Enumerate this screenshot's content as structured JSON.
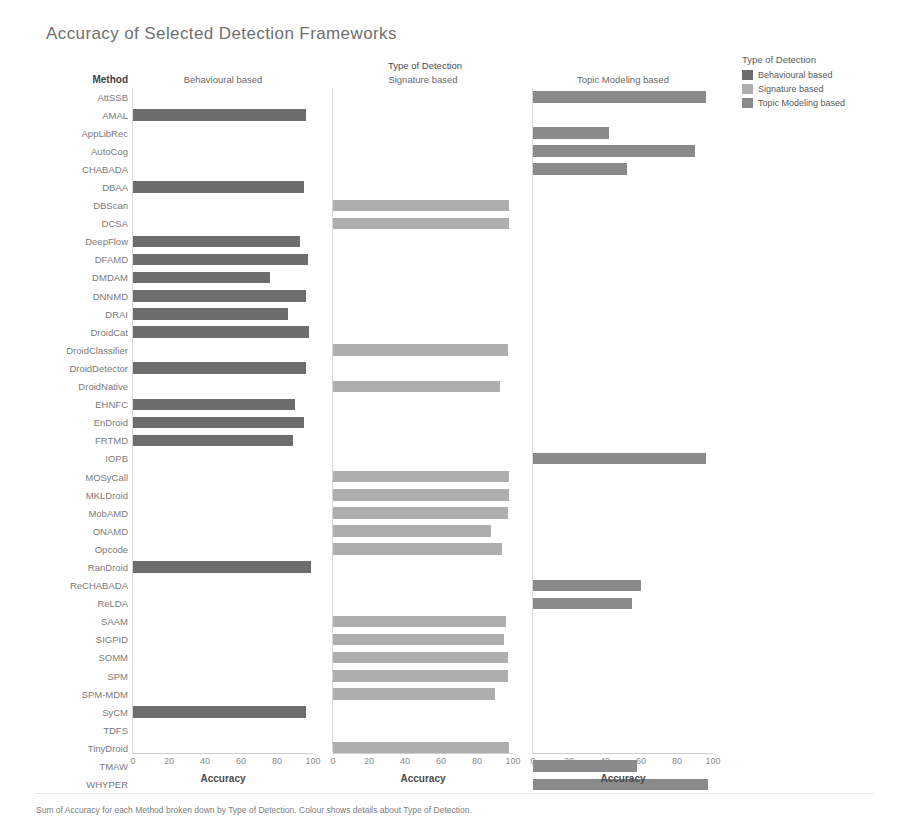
{
  "title": "Accuracy of Selected Detection Frameworks",
  "method_header": "Method",
  "column_group_title": "Type of Detection",
  "axis_title": "Accuracy",
  "footer": "Sum of Accuracy for each Method broken down by Type of Detection.  Colour shows details about Type of Detection.",
  "legend": {
    "title": "Type of Detection",
    "items": [
      {
        "label": "Behavioural based",
        "color": "#6d6d6d"
      },
      {
        "label": "Signature based",
        "color": "#aeaeae"
      },
      {
        "label": "Topic Modeling based",
        "color": "#8a8a8a"
      }
    ]
  },
  "chart_data": {
    "type": "bar",
    "title": "Accuracy of Selected Detection Frameworks",
    "xlabel": "Accuracy",
    "ylabel": "Method",
    "xlim": [
      0,
      100
    ],
    "ticks": [
      0,
      20,
      40,
      60,
      80,
      100
    ],
    "grid": false,
    "legend_position": "right",
    "panels": [
      "Behavioural based",
      "Signature based",
      "Topic Modeling based"
    ],
    "panel_colors": [
      "#6d6d6d",
      "#aeaeae",
      "#8a8a8a"
    ],
    "categories": [
      "AttSSB",
      "AMAL",
      "AppLibRec",
      "AutoCog",
      "CHABADA",
      "DBAA",
      "DBScan",
      "DCSA",
      "DeepFlow",
      "DFAMD",
      "DMDAM",
      "DNNMD",
      "DRAI",
      "DroidCat",
      "DroidClassifier",
      "DroidDetector",
      "DroidNative",
      "EHNFC",
      "EnDroid",
      "FRTMD",
      "IOPB",
      "MOSyCall",
      "MKLDroid",
      "MobAMD",
      "ONAMD",
      "Opcode",
      "RanDroid",
      "ReCHABADA",
      "ReLDA",
      "SAAM",
      "SIGPID",
      "SOMM",
      "SPM",
      "SPM-MDM",
      "SyCM",
      "TDFS",
      "TinyDroid",
      "TMAW",
      "WHYPER"
    ],
    "series": [
      {
        "name": "Behavioural based",
        "values": [
          null,
          96,
          null,
          null,
          null,
          95,
          null,
          null,
          93,
          97,
          76,
          96,
          86,
          98,
          null,
          96,
          null,
          90,
          95,
          89,
          null,
          null,
          null,
          null,
          null,
          null,
          99,
          null,
          null,
          null,
          null,
          null,
          null,
          null,
          96,
          null,
          null,
          null,
          null
        ]
      },
      {
        "name": "Signature based",
        "values": [
          null,
          null,
          null,
          null,
          null,
          null,
          98,
          98,
          null,
          null,
          null,
          null,
          null,
          null,
          97,
          null,
          93,
          null,
          null,
          null,
          null,
          98,
          98,
          97,
          88,
          94,
          null,
          null,
          null,
          96,
          95,
          97,
          97,
          90,
          null,
          null,
          98,
          null,
          null
        ]
      },
      {
        "name": "Topic Modeling based",
        "values": [
          96,
          null,
          42,
          90,
          52,
          null,
          null,
          null,
          null,
          null,
          null,
          null,
          null,
          null,
          null,
          null,
          null,
          null,
          null,
          null,
          96,
          null,
          null,
          null,
          null,
          null,
          null,
          60,
          55,
          null,
          null,
          null,
          null,
          null,
          null,
          null,
          null,
          58,
          97
        ]
      }
    ]
  }
}
